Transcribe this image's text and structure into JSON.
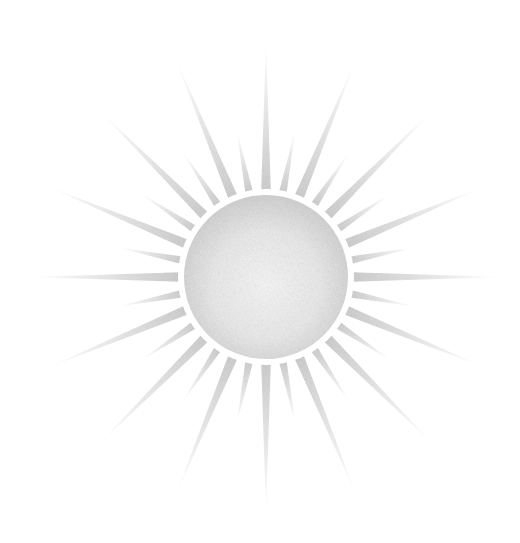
{
  "image": {
    "subject": "Stylized sun illustration",
    "background_color": "#ffffff",
    "sun": {
      "center": [
        266,
        277
      ],
      "disc_radius": 82,
      "ring_width": 6,
      "ring_color": "#ffffff",
      "disc_color_edge": "#d6d6d6",
      "disc_color_center": "#f6f6f6",
      "ray_color": "#cfcfcf",
      "ray_count": 32,
      "long_ray_length": 235,
      "short_ray_length": 150,
      "ray_base_half_width_deg": 3.2
    }
  }
}
